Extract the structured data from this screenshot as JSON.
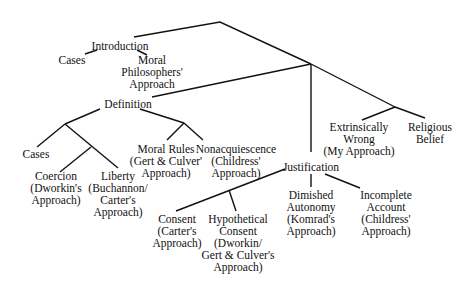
{
  "diagram": {
    "type": "tree",
    "line_color": "#111111",
    "nodes": {
      "introduction": {
        "lines": [
          "Introduction"
        ]
      },
      "intro_cases": {
        "lines": [
          "Cases"
        ]
      },
      "moral_philosophers": {
        "lines": [
          "Moral",
          "Philosophers'",
          "Approach"
        ]
      },
      "definition": {
        "lines": [
          "Definition"
        ]
      },
      "def_cases": {
        "lines": [
          "Cases"
        ]
      },
      "coercion": {
        "lines": [
          "Coercion",
          "(Dworkin's",
          "Approach)"
        ]
      },
      "liberty": {
        "lines": [
          "Liberty",
          "(Buchannon/",
          "Carter's",
          "Approach)"
        ]
      },
      "moral_rules": {
        "lines": [
          "Moral Rules",
          "(Gert & Culver'",
          "Approach)"
        ]
      },
      "nonacquiescence": {
        "lines": [
          "Nonacquiescence",
          "(Childress'",
          "Approach)"
        ]
      },
      "extrinsically_wrong": {
        "lines": [
          "Extrinsically",
          "Wrong",
          "(My Approach)"
        ]
      },
      "religious_belief": {
        "lines": [
          "Religious",
          "Belief"
        ]
      },
      "justification": {
        "lines": [
          "Justification"
        ]
      },
      "consent": {
        "lines": [
          "Consent",
          "(Carter's",
          "Approach)"
        ]
      },
      "hypothetical_consent": {
        "lines": [
          "Hypothetical",
          "Consent",
          "(Dworkin/",
          "Gert & Culver's",
          "Approach)"
        ]
      },
      "dimished_autonomy": {
        "lines": [
          "Dimished",
          "Autonomy",
          "(Komrad's",
          "Approach)"
        ]
      },
      "incomplete_account": {
        "lines": [
          "Incomplete",
          "Account",
          "(Childress'",
          "Approach)"
        ]
      }
    }
  }
}
